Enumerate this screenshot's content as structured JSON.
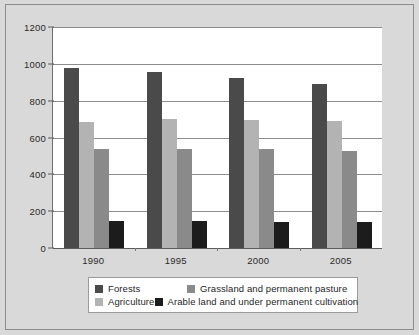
{
  "chart_data": {
    "type": "bar",
    "title": "",
    "subtitle": "",
    "xlabel": "",
    "ylabel": "",
    "categories": [
      "1990",
      "1995",
      "2000",
      "2005"
    ],
    "series": [
      {
        "name": "Forests",
        "color": "#4a4a4a",
        "values": [
          980,
          955,
          925,
          893
        ]
      },
      {
        "name": "Agriculture",
        "color": "#b3b3b3",
        "values": [
          682,
          700,
          697,
          692
        ]
      },
      {
        "name": "Grassland and permanent pasture",
        "color": "#8a8a8a",
        "values": [
          535,
          540,
          535,
          528
        ]
      },
      {
        "name": "Arable land and under permanent cultivation",
        "color": "#1c1c1c",
        "values": [
          145,
          147,
          143,
          140
        ]
      }
    ],
    "ylim": [
      0,
      1200
    ],
    "ytick_labels": [
      "0",
      "200",
      "400",
      "600",
      "800",
      "1000",
      "1200"
    ],
    "ytick_values": [
      0,
      200,
      400,
      600,
      800,
      1000,
      1200
    ],
    "grid": true,
    "legend_position": "bottom"
  },
  "legend": {
    "rows": [
      [
        {
          "label": "Forests",
          "swatch": "series-forests"
        },
        {
          "label": "Grassland and permanent pasture",
          "swatch": "series-grassland"
        }
      ],
      [
        {
          "label": "Agriculture",
          "swatch": "series-agriculture"
        },
        {
          "label": "Arable land and under permanent cultivation",
          "swatch": "series-arable"
        }
      ]
    ]
  },
  "colors": {
    "background": "#d9d9d9",
    "plot_background": "#ffffff",
    "gridline": "#8c8c8c",
    "axis": "#5c5c5c",
    "forests": "#4a4a4a",
    "agriculture": "#b3b3b3",
    "grassland": "#8a8a8a",
    "arable": "#1c1c1c"
  }
}
